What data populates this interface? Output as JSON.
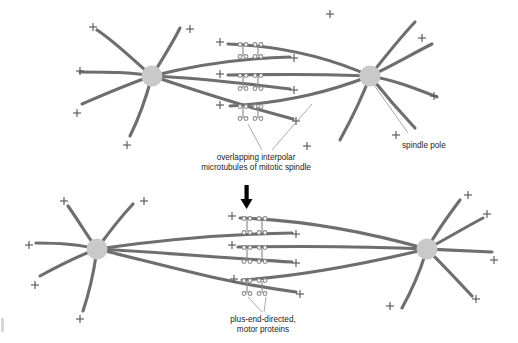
{
  "figure": {
    "background_color": "#ffffff",
    "microtubule_color": "#6e6e6e",
    "pole_color": "#c9c9c9",
    "motor_color": "#8a8a8a",
    "leader_color": "#8c8c8c",
    "arrow_color": "#000000",
    "text_color": "#1d1d1d"
  },
  "labels": {
    "spindle_pole": "spindle pole",
    "interpolar_line1": "overlapping interpolar",
    "interpolar_line2": "microtubules of mitotic spindle",
    "motor_line1": "plus-end-directed,",
    "motor_line2": "motor proteins",
    "plus_end_symbol": "+"
  },
  "panels": [
    {
      "name": "before-elongation",
      "pole_left_x": 152,
      "pole_right_x": 370,
      "pole_y": 76,
      "pole_radius": 10.5,
      "interpolar_pairs": 3,
      "overlap_center_x": 255
    },
    {
      "name": "after-elongation",
      "pole_left_x": 97,
      "pole_right_x": 427,
      "pole_y": 249,
      "pole_radius": 10.5,
      "interpolar_pairs": 3,
      "overlap_center_x": 258
    }
  ],
  "transition": {
    "arrow_direction": "down",
    "arrow_x": 247,
    "arrow_top_y": 185,
    "arrow_bottom_y": 209
  }
}
